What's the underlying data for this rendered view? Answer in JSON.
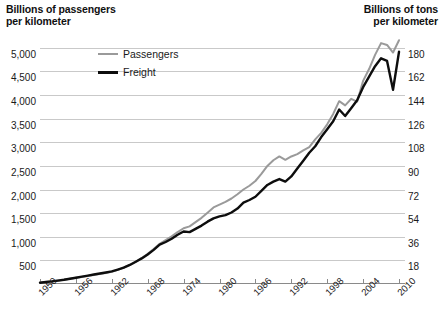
{
  "chart_data": {
    "type": "line",
    "title": "",
    "left_axis": {
      "label": "Billions of passengers\nper kilometer",
      "ticks": [
        "500",
        "1,000",
        "1,500",
        "2,000",
        "2,500",
        "3,000",
        "3,500",
        "4,000",
        "4,500",
        "5,000"
      ],
      "tick_values": [
        500,
        1000,
        1500,
        2000,
        2500,
        3000,
        3500,
        4000,
        4500,
        5000
      ],
      "lim": [
        0,
        5250
      ]
    },
    "right_axis": {
      "label": "Billions of tons\nper kilometer",
      "ticks": [
        "18",
        "36",
        "54",
        "72",
        "90",
        "108",
        "126",
        "144",
        "162",
        "180"
      ],
      "tick_values": [
        18,
        36,
        54,
        72,
        90,
        108,
        126,
        144,
        162,
        180
      ],
      "lim": [
        0,
        189
      ]
    },
    "xlabel": "",
    "x_ticks": [
      "1950",
      "1956",
      "1962",
      "1968",
      "1974",
      "1980",
      "1986",
      "1992",
      "1998",
      "2004",
      "2010"
    ],
    "x_tick_values": [
      1950,
      1956,
      1962,
      1968,
      1974,
      1980,
      1986,
      1992,
      1998,
      2004,
      2010
    ],
    "xlim": [
      1950,
      2011
    ],
    "grid": true,
    "legend_position": "top-left-inside",
    "series": [
      {
        "name": "Passengers",
        "axis": "left",
        "color": "#9a9a9a",
        "unit": "billions of passenger-kilometers",
        "x": [
          1950,
          1951,
          1952,
          1953,
          1954,
          1955,
          1956,
          1957,
          1958,
          1959,
          1960,
          1961,
          1962,
          1963,
          1964,
          1965,
          1966,
          1967,
          1968,
          1969,
          1970,
          1971,
          1972,
          1973,
          1974,
          1975,
          1976,
          1977,
          1978,
          1979,
          1980,
          1981,
          1982,
          1983,
          1984,
          1985,
          1986,
          1987,
          1988,
          1989,
          1990,
          1991,
          1992,
          1993,
          1994,
          1995,
          1996,
          1997,
          1998,
          1999,
          2000,
          2001,
          2002,
          2003,
          2004,
          2005,
          2006,
          2007,
          2008,
          2009,
          2010
        ],
        "values": [
          30,
          45,
          60,
          75,
          90,
          110,
          130,
          150,
          170,
          190,
          210,
          235,
          260,
          300,
          350,
          400,
          470,
          550,
          640,
          740,
          850,
          930,
          1010,
          1100,
          1180,
          1220,
          1310,
          1400,
          1510,
          1620,
          1680,
          1740,
          1810,
          1900,
          2000,
          2080,
          2180,
          2330,
          2500,
          2620,
          2700,
          2630,
          2700,
          2750,
          2830,
          2900,
          3060,
          3200,
          3380,
          3600,
          3870,
          3780,
          3920,
          3860,
          4300,
          4550,
          4850,
          5100,
          5060,
          4900,
          5160
        ],
        "note": "Gray line read against left axis"
      },
      {
        "name": "Freight",
        "axis": "right",
        "color": "#0d0d0d",
        "unit": "billions of ton-kilometers",
        "x": [
          1950,
          1951,
          1952,
          1953,
          1954,
          1955,
          1956,
          1957,
          1958,
          1959,
          1960,
          1961,
          1962,
          1963,
          1964,
          1965,
          1966,
          1967,
          1968,
          1969,
          1970,
          1971,
          1972,
          1973,
          1974,
          1975,
          1976,
          1977,
          1978,
          1979,
          1980,
          1981,
          1982,
          1983,
          1984,
          1985,
          1986,
          1987,
          1988,
          1989,
          1990,
          1991,
          1992,
          1993,
          1994,
          1995,
          1996,
          1997,
          1998,
          1999,
          2000,
          2001,
          2002,
          2003,
          2004,
          2005,
          2006,
          2007,
          2008,
          2009,
          2010
        ],
        "values": [
          1.0,
          1.5,
          2.0,
          2.6,
          3.2,
          4.0,
          4.8,
          5.6,
          6.4,
          7.2,
          8.0,
          8.8,
          9.6,
          11.0,
          12.5,
          14.5,
          17.0,
          19.5,
          22.5,
          26.0,
          30.0,
          32.0,
          34.5,
          37.5,
          40.0,
          39.5,
          42.0,
          44.5,
          47.5,
          50.0,
          51.5,
          52.5,
          54.5,
          57.5,
          62.0,
          64.0,
          66.5,
          71.0,
          75.5,
          78.0,
          80.0,
          78.0,
          82.0,
          88.0,
          94.0,
          100.0,
          105.0,
          112.0,
          118.0,
          124.0,
          133.0,
          128.0,
          134.0,
          140.0,
          150.0,
          158.0,
          166.0,
          172.0,
          170.0,
          148.0,
          177.0
        ],
        "note": "Black line read against right axis"
      }
    ]
  },
  "legend": {
    "items": [
      {
        "label": "Passengers",
        "color": "#9a9a9a"
      },
      {
        "label": "Freight",
        "color": "#0d0d0d"
      }
    ]
  }
}
